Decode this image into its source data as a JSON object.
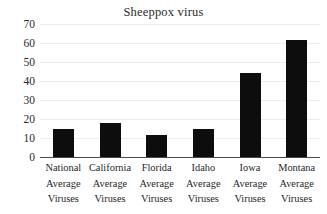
{
  "chart_data": {
    "type": "bar",
    "title": "Sheeppox virus",
    "xlabel": "",
    "ylabel": "",
    "ylim": [
      0,
      70
    ],
    "ytick_labels": [
      "70",
      "60",
      "50",
      "40",
      "30",
      "20",
      "10",
      "0"
    ],
    "yticks": [
      70,
      60,
      50,
      40,
      30,
      20,
      10,
      0
    ],
    "grid": true,
    "legend": false,
    "categories": [
      "National Average Viruses",
      "California Average Viruses",
      "Florida Average Viruses",
      "Idaho Average Viruses",
      "Iowa Average Viruses",
      "Montana Average Viruses"
    ],
    "category_lines": [
      [
        "National",
        "Average",
        "Viruses"
      ],
      [
        "California",
        "Average",
        "Viruses"
      ],
      [
        "Florida",
        "Average",
        "Viruses"
      ],
      [
        "Idaho",
        "Average",
        "Viruses"
      ],
      [
        "Iowa",
        "Average",
        "Viruses"
      ],
      [
        "Montana",
        "Average",
        "Viruses"
      ]
    ],
    "values": [
      15,
      18,
      11.5,
      15,
      44,
      61.5
    ],
    "bar_color": "#0d0d0d",
    "gridline_color": "#ececec",
    "axis_color": "#4a4a4a",
    "background_color": "#ffffff"
  }
}
